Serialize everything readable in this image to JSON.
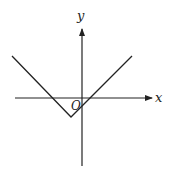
{
  "diagram": {
    "axes": {
      "x_label": "x",
      "y_label": "y",
      "origin_label": "O"
    },
    "graph": {
      "type": "V-shape",
      "vertex_quadrant": "III",
      "opens": "upward"
    },
    "colors": {
      "stroke": "#222222",
      "background": "#ffffff"
    }
  }
}
